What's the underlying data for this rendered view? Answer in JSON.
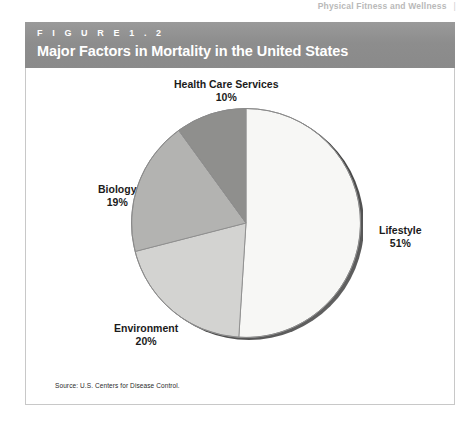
{
  "running_head": {
    "text": "Physical Fitness and Wellness",
    "rule": "|"
  },
  "figure": {
    "number_label": "F I G U R E   1 . 2",
    "title": "Major Factors in Mortality in the United States",
    "source": "Source: U.S. Centers for Disease Control.",
    "header_color": "#8d8d8d",
    "header_text_color": "#ffffff",
    "border_color": "#c8c8c8"
  },
  "chart_data": {
    "type": "pie",
    "title": "Major Factors in Mortality in the United States",
    "subtitle": "",
    "xlabel": "",
    "ylabel": "",
    "legend_position": "none",
    "grid": false,
    "source": "Source: U.S. Centers for Disease Control.",
    "categories": [
      "Lifestyle",
      "Environment",
      "Biology",
      "Health Care Services"
    ],
    "values": [
      51,
      20,
      19,
      10
    ],
    "unit": "%",
    "total": 100,
    "start_angle_deg": 0,
    "direction": "clockwise",
    "slices": [
      {
        "label": "Lifestyle",
        "value": 51,
        "value_text": "51%",
        "color": "#f7f7f5",
        "start_deg": 0,
        "end_deg": 183.6
      },
      {
        "label": "Environment",
        "value": 20,
        "value_text": "20%",
        "color": "#d3d3d1",
        "start_deg": 183.6,
        "end_deg": 255.6
      },
      {
        "label": "Biology",
        "value": 19,
        "value_text": "19%",
        "color": "#b3b3b1",
        "start_deg": 255.6,
        "end_deg": 324.0
      },
      {
        "label": "Health Care Services",
        "value": 10,
        "value_text": "10%",
        "color": "#8f8f8d",
        "start_deg": 324.0,
        "end_deg": 360.0
      }
    ]
  },
  "labels": {
    "health": {
      "name": "Health Care Services",
      "pct": "10%"
    },
    "biology": {
      "name": "Biology",
      "pct": "19%"
    },
    "environment": {
      "name": "Environment",
      "pct": "20%"
    },
    "lifestyle": {
      "name": "Lifestyle",
      "pct": "51%"
    }
  }
}
